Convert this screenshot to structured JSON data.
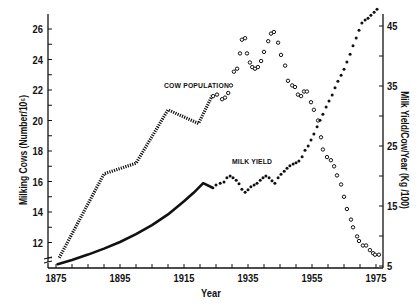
{
  "chart_data": {
    "type": "line",
    "title": "",
    "xlabel": "Year",
    "ylabel": "Milking Cows (Number/10^6)",
    "ylabel_right": "Milk Yield/Cow/Year (Kg /100)",
    "xlim": [
      1875,
      1975
    ],
    "ylim": [
      10.5,
      27
    ],
    "ylim_right": [
      5,
      48
    ],
    "x_ticks": [
      1875,
      1895,
      1915,
      1935,
      1955,
      1975
    ],
    "x_minor_step": 5,
    "y_ticks": [
      12,
      14,
      16,
      18,
      20,
      22,
      24,
      26
    ],
    "y_minor_step": 1,
    "y_ticks_right": [
      5,
      15,
      25,
      35,
      45
    ],
    "y_right_minor_step": 5,
    "grid": false,
    "axis_break_left": true,
    "series": [
      {
        "name": "COW POPULATION (estimated line)",
        "axis": "left",
        "style": "dotted-thick",
        "x": [
          1876,
          1890,
          1900,
          1910,
          1919.5,
          1924
        ],
        "values": [
          11.0,
          16.5,
          17.2,
          20.7,
          19.8,
          21.7
        ]
      },
      {
        "name": "COW POPULATION",
        "axis": "left",
        "style": "open-circles",
        "x": [
          1924.1,
          1925.3,
          1926.9,
          1927.8,
          1928.8,
          1929.7,
          1930.6,
          1931.6,
          1932.5,
          1933.1,
          1934.1,
          1934.7,
          1935.6,
          1936.3,
          1937.2,
          1938.1,
          1939.1,
          1940.0,
          1941.3,
          1942.2,
          1943.1,
          1944.4,
          1945.3,
          1946.6,
          1947.5,
          1948.8,
          1949.7,
          1950.6,
          1951.6,
          1952.5,
          1953.4,
          1954.7,
          1955.6,
          1956.9,
          1957.8,
          1958.4,
          1959.7,
          1960.9,
          1961.9,
          1962.8,
          1964.1,
          1965.0,
          1965.9,
          1967.2,
          1967.8,
          1969.1,
          1969.7,
          1970.9,
          1971.9,
          1973.1,
          1974.1,
          1974.7,
          1975.9
        ],
        "values": [
          21.6,
          21.7,
          21.4,
          21.5,
          21.8,
          22.3,
          23.2,
          23.4,
          24.4,
          25.3,
          25.4,
          24.4,
          23.8,
          23.5,
          23.4,
          23.5,
          23.9,
          24.5,
          25.2,
          25.7,
          25.8,
          25.1,
          24.3,
          23.6,
          22.6,
          22.3,
          22.2,
          21.7,
          21.6,
          21.9,
          21.9,
          21.2,
          20.7,
          20.0,
          18.9,
          18.1,
          17.6,
          17.4,
          17.0,
          16.4,
          15.8,
          15.0,
          14.2,
          13.5,
          13.0,
          12.4,
          12.1,
          11.8,
          11.8,
          11.5,
          11.3,
          11.2,
          11.2
        ]
      },
      {
        "name": "MILK YIELD (estimated curve)",
        "axis": "right",
        "style": "solid-thick",
        "x": [
          1875.5,
          1880,
          1885,
          1890,
          1895,
          1900,
          1905,
          1910,
          1915,
          1918,
          1921,
          1924.1
        ],
        "values": [
          5.3,
          6.0,
          6.9,
          7.9,
          9.0,
          10.3,
          11.8,
          13.6,
          15.8,
          17.2,
          18.8,
          18.0
        ]
      },
      {
        "name": "MILK YIELD",
        "axis": "right",
        "style": "filled-dots",
        "x": [
          1925.0,
          1926.3,
          1927.5,
          1928.4,
          1929.4,
          1930.3,
          1931.3,
          1932.2,
          1933.1,
          1934.1,
          1935.0,
          1935.9,
          1936.9,
          1937.8,
          1938.8,
          1939.7,
          1940.6,
          1941.6,
          1942.5,
          1943.4,
          1944.4,
          1945.3,
          1946.3,
          1947.2,
          1948.1,
          1949.1,
          1950.0,
          1950.9,
          1951.9,
          1952.8,
          1953.8,
          1954.7,
          1955.6,
          1956.6,
          1957.5,
          1958.4,
          1959.4,
          1960.3,
          1961.3,
          1962.2,
          1963.1,
          1964.1,
          1965.0,
          1965.9,
          1966.9,
          1967.8,
          1968.8,
          1969.7,
          1970.6,
          1971.6,
          1972.5,
          1973.4,
          1974.4,
          1975.3
        ],
        "values": [
          18.5,
          18.8,
          19.0,
          19.7,
          20.0,
          19.7,
          19.3,
          18.7,
          17.8,
          17.3,
          17.7,
          18.2,
          18.5,
          18.8,
          19.3,
          19.7,
          20.0,
          19.7,
          19.2,
          18.8,
          19.7,
          20.3,
          20.8,
          21.3,
          21.7,
          22.0,
          22.2,
          22.5,
          23.2,
          24.3,
          25.0,
          26.0,
          27.0,
          28.2,
          29.3,
          30.3,
          31.5,
          32.5,
          33.5,
          34.7,
          35.8,
          36.8,
          37.8,
          39.0,
          40.3,
          41.7,
          43.0,
          44.3,
          45.5,
          46.0,
          46.3,
          46.8,
          47.3,
          47.8
        ]
      }
    ],
    "annotations": [
      {
        "text": "COW POPULATION",
        "near_series": "COW POPULATION"
      },
      {
        "text": "MILK YIELD",
        "near_series": "MILK YIELD"
      }
    ]
  },
  "labels": {
    "xlabel": "Year",
    "ylabel_left": "Milking Cows (Number/10⁶)",
    "ylabel_right": "Milk Yield/Cow/Year (Kg /100)",
    "cow_population": "COW POPULATION",
    "milk_yield": "MILK YIELD"
  },
  "colors": {
    "ink": "#111111",
    "background": "#ffffff"
  }
}
